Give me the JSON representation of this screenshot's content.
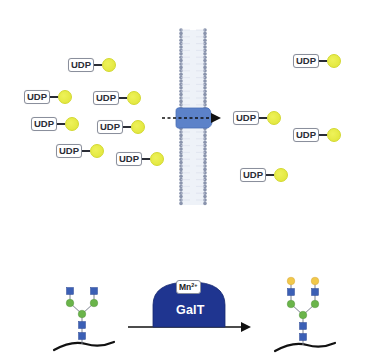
{
  "figure": {
    "upper_panel": {
      "description": "UDP-galactose transport across a lipid bilayer via a transporter",
      "membrane": {
        "color": "#8a94ad",
        "x_left": 181,
        "x_right": 205,
        "y_top": 30,
        "y_bottom": 205
      },
      "transporter": {
        "color": "#5c82c9",
        "cx": 193,
        "cy": 118
      },
      "transport_arrow": {
        "style": "dashed",
        "direction": "left-to-right",
        "x_start": 162,
        "x_end": 222,
        "y": 118
      },
      "left_molecules": [
        {
          "label": "UDP",
          "x": 68,
          "y": 58
        },
        {
          "label": "UDP",
          "x": 24,
          "y": 90
        },
        {
          "label": "UDP",
          "x": 93,
          "y": 91
        },
        {
          "label": "UDP",
          "x": 31,
          "y": 117
        },
        {
          "label": "UDP",
          "x": 97,
          "y": 120
        },
        {
          "label": "UDP",
          "x": 56,
          "y": 144
        },
        {
          "label": "UDP",
          "x": 116,
          "y": 152
        }
      ],
      "right_molecules": [
        {
          "label": "UDP",
          "x": 233,
          "y": 111
        },
        {
          "label": "UDP",
          "x": 293,
          "y": 54
        },
        {
          "label": "UDP",
          "x": 293,
          "y": 128
        },
        {
          "label": "UDP",
          "x": 240,
          "y": 168
        }
      ],
      "sugar_color": "#e4e83c"
    },
    "lower_panel": {
      "description": "GalT-catalyzed galactosylation of a biantennary N-glycan",
      "enzyme": {
        "label": "GalT",
        "color": "#1f3590"
      },
      "cofactor": {
        "label": "Mn",
        "charge": "2+"
      },
      "substrate_glycan": {
        "core": [
          "GlcNAc",
          "GlcNAc",
          "Man"
        ],
        "branches": [
          [
            "Man",
            "GlcNAc"
          ],
          [
            "Man",
            "GlcNAc"
          ]
        ],
        "colors": {
          "GlcNAc": "#3b5fb5",
          "Man": "#6ab44a"
        }
      },
      "product_glycan": {
        "core": [
          "GlcNAc",
          "GlcNAc",
          "Man"
        ],
        "branches": [
          [
            "Man",
            "GlcNAc",
            "Gal"
          ],
          [
            "Man",
            "GlcNAc",
            "Gal"
          ]
        ],
        "colors": {
          "GlcNAc": "#3b5fb5",
          "Man": "#6ab44a",
          "Gal": "#f1c84a"
        }
      },
      "reaction_arrow": {
        "x_start": 128,
        "x_end": 252,
        "y": 327
      }
    }
  }
}
